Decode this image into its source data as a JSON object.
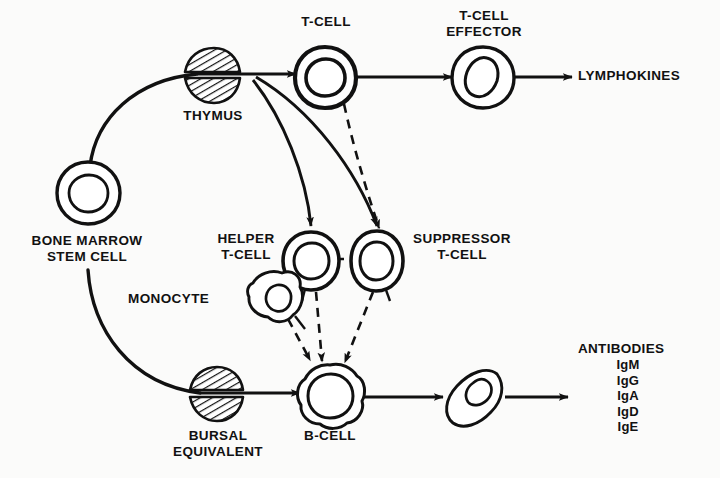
{
  "figure": {
    "kind": "immune-system-cell-lineage-diagram",
    "background_color": "#fbfbfa",
    "ink_color": "#111111"
  },
  "labels": {
    "bone_marrow_stem_cell": "BONE MARROW\nSTEM CELL",
    "thymus": "THYMUS",
    "bursal_equivalent": "BURSAL\nEQUIVALENT",
    "t_cell": "T-CELL",
    "t_cell_effector": "T-CELL\nEFFECTOR",
    "lymphokines": "LYMPHOKINES",
    "helper_t_cell": "HELPER\nT-CELL",
    "suppressor_t_cell": "SUPPRESSOR\nT-CELL",
    "monocyte": "MONOCYTE",
    "b_cell": "B-CELL",
    "antibodies_title": "ANTIBODIES",
    "antibody_classes": [
      "IgM",
      "IgG",
      "IgA",
      "IgD",
      "IgE"
    ]
  },
  "nodes": [
    {
      "id": "stem-cell",
      "label": "BONE MARROW STEM CELL",
      "shape": "round-cell-with-nucleus",
      "x": 88,
      "y": 192
    },
    {
      "id": "thymus",
      "label": "THYMUS",
      "shape": "hatched-split-ellipse",
      "x": 211,
      "y": 76
    },
    {
      "id": "bursal-equivalent",
      "label": "BURSAL EQUIVALENT",
      "shape": "hatched-split-ellipse",
      "x": 216,
      "y": 395
    },
    {
      "id": "t-cell",
      "label": "T-CELL",
      "shape": "round-cell-with-nucleus",
      "x": 325,
      "y": 77
    },
    {
      "id": "t-cell-effector",
      "label": "T-CELL EFFECTOR",
      "shape": "round-cell-with-nucleus",
      "x": 483,
      "y": 77
    },
    {
      "id": "helper-t-cell",
      "label": "HELPER T-CELL",
      "shape": "round-cell-with-nucleus",
      "x": 311,
      "y": 262
    },
    {
      "id": "suppressor-t-cell",
      "label": "SUPPRESSOR T-CELL",
      "shape": "round-cell-with-nucleus",
      "x": 377,
      "y": 262
    },
    {
      "id": "monocyte",
      "label": "MONOCYTE",
      "shape": "amoeboid-cell",
      "x": 272,
      "y": 298
    },
    {
      "id": "b-cell",
      "label": "B-CELL",
      "shape": "lumpy-cell-with-nucleus",
      "x": 330,
      "y": 397
    },
    {
      "id": "plasma-cell",
      "label": "",
      "shape": "elongated-oval-cell",
      "x": 477,
      "y": 398
    }
  ],
  "edges": [
    {
      "from": "stem-cell",
      "to": "t-cell",
      "style": "solid",
      "via": "thymus"
    },
    {
      "from": "stem-cell",
      "to": "b-cell",
      "style": "solid",
      "via": "bursal-equivalent"
    },
    {
      "from": "t-cell",
      "to": "t-cell-effector",
      "style": "solid"
    },
    {
      "from": "t-cell-effector",
      "to": "lymphokines",
      "style": "solid"
    },
    {
      "from": "thymus",
      "to": "helper-t-cell",
      "style": "solid"
    },
    {
      "from": "thymus",
      "to": "suppressor-t-cell",
      "style": "solid"
    },
    {
      "from": "t-cell",
      "to": "suppressor-t-cell",
      "style": "dashed"
    },
    {
      "from": "helper-t-cell",
      "to": "suppressor-t-cell",
      "style": "dashed"
    },
    {
      "from": "helper-t-cell",
      "to": "b-cell",
      "style": "dashed"
    },
    {
      "from": "suppressor-t-cell",
      "to": "b-cell",
      "style": "dashed"
    },
    {
      "from": "monocyte",
      "to": "b-cell",
      "style": "dashed"
    },
    {
      "from": "b-cell",
      "to": "plasma-cell",
      "style": "solid"
    },
    {
      "from": "plasma-cell",
      "to": "antibodies",
      "style": "solid"
    }
  ]
}
